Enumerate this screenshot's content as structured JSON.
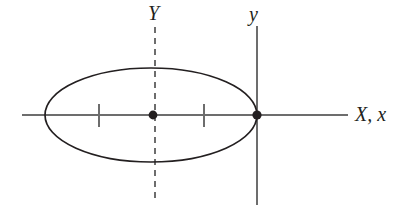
{
  "figure": {
    "background_color": "#ffffff",
    "stroke_color": "#231f20",
    "width": 409,
    "height": 218
  },
  "labels": {
    "body_y_axis": "Y",
    "fixed_y_axis": "y",
    "horizontal_axis": "X, x"
  },
  "chart_data": {
    "type": "scatter",
    "xlabel": "X, x",
    "ylabel": "Y",
    "grid": false,
    "legend": null,
    "xlim": [
      22,
      348
    ],
    "ylim": [
      26,
      205
    ],
    "annotations": [
      {
        "name": "body-y-axis-label",
        "text": "Y",
        "x": 153,
        "y": 13
      },
      {
        "name": "space-y-axis-label",
        "text": "y",
        "x": 257,
        "y": 14
      },
      {
        "name": "x-axis-label",
        "text": "X, x",
        "x": 377,
        "y": 114
      }
    ],
    "shapes": [
      {
        "name": "ellipse-outline",
        "type": "ellipse",
        "cx": 151,
        "cy": 115,
        "rx": 106,
        "ry": 47,
        "fill": "none",
        "stroke": "#231f20",
        "stroke_width": 1.7
      },
      {
        "name": "horizontal-axis",
        "type": "line",
        "x1": 22,
        "y1": 115,
        "x2": 348,
        "y2": 115,
        "stroke": "#6d6d6d",
        "stroke_width": 1.1,
        "dash": null
      },
      {
        "name": "body-y-axis-dashed",
        "type": "line",
        "x1": 155,
        "y1": 27,
        "x2": 155,
        "y2": 201,
        "stroke": "#6d6d6d",
        "stroke_width": 1.2,
        "dash": "6 5"
      },
      {
        "name": "space-y-axis-solid",
        "type": "line",
        "x1": 257,
        "y1": 26,
        "x2": 257,
        "y2": 205,
        "stroke": "#6d6d6d",
        "stroke_width": 1.2,
        "dash": null
      },
      {
        "name": "tick-left",
        "type": "line",
        "x1": 99,
        "y1": 104,
        "x2": 99,
        "y2": 127,
        "stroke": "#6d6d6d",
        "stroke_width": 1.1
      },
      {
        "name": "tick-right",
        "type": "line",
        "x1": 204,
        "y1": 104,
        "x2": 204,
        "y2": 127,
        "stroke": "#6d6d6d",
        "stroke_width": 1.1
      }
    ],
    "points": [
      {
        "name": "center-point",
        "x": 153,
        "y": 115,
        "r": 4.4,
        "color": "#231f20"
      },
      {
        "name": "contact-point",
        "x": 257,
        "y": 115,
        "r": 4.6,
        "color": "#231f20"
      }
    ]
  }
}
